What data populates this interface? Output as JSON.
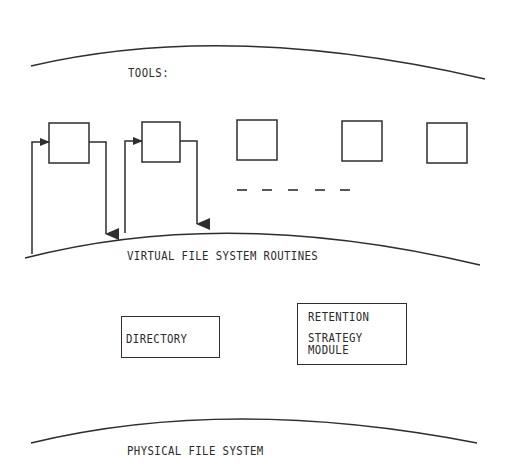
{
  "diagram": {
    "layers": {
      "tools": {
        "label": "TOOLS:"
      },
      "virtual": {
        "label": "VIRTUAL FILE SYSTEM ROUTINES"
      },
      "physical": {
        "label": "PHYSICAL FILE SYSTEM"
      }
    },
    "modules": {
      "directory": {
        "label": "DIRECTORY"
      },
      "retention": {
        "line1": "RETENTION",
        "line2": "STRATEGY",
        "line3": "MODULE"
      }
    },
    "tool_boxes_count": 5,
    "ellipsis": "- - - - -",
    "colors": {
      "ink": "#2e2e2e",
      "background": "#ffffff"
    }
  }
}
